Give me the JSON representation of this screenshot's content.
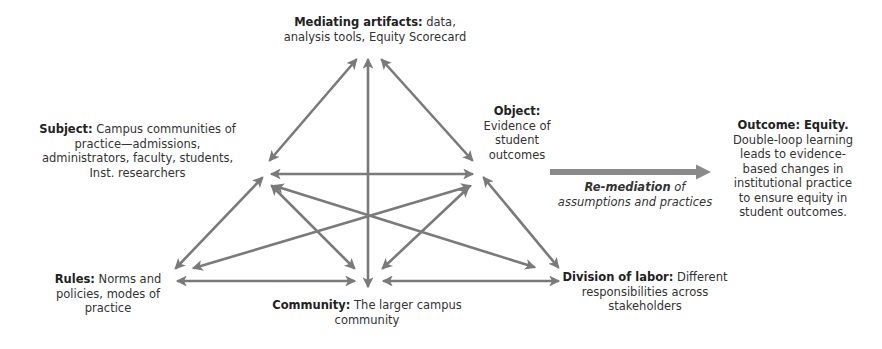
{
  "diagram": {
    "nodes": {
      "mediating_artifacts": {
        "label": "Mediating artifacts:",
        "text": " data, analysis tools, Equity Scorecard"
      },
      "subject": {
        "label": "Subject:",
        "text": " Campus communities of practice—admissions, administrators, faculty, students, Inst. researchers"
      },
      "object": {
        "label": "Object:",
        "text": " Evidence of student outcomes"
      },
      "rules": {
        "label": "Rules:",
        "text": " Norms and policies, modes of practice"
      },
      "community": {
        "label": "Community:",
        "text": " The larger campus community"
      },
      "division_of_labor": {
        "label": "Division of labor:",
        "text": " Different responsibilities across stakeholders"
      },
      "outcome": {
        "label": "Outcome: Equity.",
        "text": " Double-loop learning leads to evidence-based changes in institutional practice to ensure equity in student outcomes."
      }
    },
    "remediation": {
      "label": "Re-mediation",
      "text": " of assumptions and practices"
    },
    "colors": {
      "arrow": "#7a7a7a",
      "big_arrow": "#8a8a8a",
      "text": "#333333"
    },
    "edges": [
      {
        "from": "mediating_artifacts",
        "to": "subject",
        "bidirectional": true
      },
      {
        "from": "mediating_artifacts",
        "to": "object",
        "bidirectional": true
      },
      {
        "from": "mediating_artifacts",
        "to": "community",
        "bidirectional": true
      },
      {
        "from": "subject",
        "to": "object",
        "bidirectional": true
      },
      {
        "from": "subject",
        "to": "rules",
        "bidirectional": true
      },
      {
        "from": "subject",
        "to": "community",
        "bidirectional": true
      },
      {
        "from": "subject",
        "to": "division_of_labor",
        "bidirectional": true
      },
      {
        "from": "object",
        "to": "rules",
        "bidirectional": true
      },
      {
        "from": "object",
        "to": "community",
        "bidirectional": true
      },
      {
        "from": "object",
        "to": "division_of_labor",
        "bidirectional": true
      },
      {
        "from": "rules",
        "to": "community",
        "bidirectional": true
      },
      {
        "from": "community",
        "to": "division_of_labor",
        "bidirectional": true
      },
      {
        "from": "object",
        "to": "outcome",
        "bidirectional": false,
        "label": "Re-mediation of assumptions and practices"
      }
    ]
  }
}
